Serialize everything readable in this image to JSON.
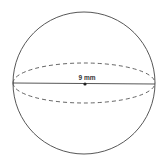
{
  "diagram": {
    "shape": "sphere",
    "diameter_label": "9 mm",
    "colors": {
      "stroke": "#444444",
      "background": "#ffffff"
    }
  }
}
